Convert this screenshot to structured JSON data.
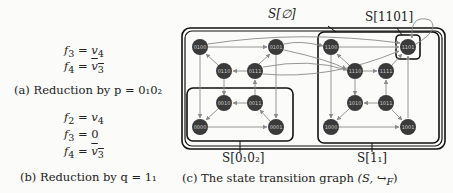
{
  "subfig_a": {
    "equations": [
      {
        "lhs": "f",
        "sub": "3",
        "rhs": "v",
        "rsub": "4",
        "overline": false
      },
      {
        "lhs": "f",
        "sub": "4",
        "rhs": "v",
        "rsub": "3",
        "overline": true
      }
    ],
    "caption": "(a) Reduction by p = 0₁0₂"
  },
  "subfig_b": {
    "equations": [
      {
        "lhs": "f",
        "sub": "2",
        "rhs": "v",
        "rsub": "4",
        "overline": false
      },
      {
        "lhs": "f",
        "sub": "3",
        "rhs": "0",
        "rsub": "",
        "overline": false
      },
      {
        "lhs": "f",
        "sub": "4",
        "rhs": "v",
        "rsub": "3",
        "overline": true
      }
    ],
    "caption": "(b) Reduction by q = 1₁"
  },
  "subfig_c": {
    "caption": "(c) The state transition graph (S, ↪ F)",
    "caption_text": "(c) The state transition graph",
    "caption_math": "(S, ↪",
    "caption_sub": "F",
    "caption_close": ")",
    "regions": {
      "outer": "S[∅]",
      "bottom_left": "S[0₁0₂]",
      "right": "S[1₁]",
      "top_right": "S[1101]"
    },
    "nodes": [
      {
        "id": "0100",
        "x": 200,
        "y": 47
      },
      {
        "id": "0101",
        "x": 276,
        "y": 47
      },
      {
        "id": "0110",
        "x": 224,
        "y": 71
      },
      {
        "id": "0111",
        "x": 255,
        "y": 71
      },
      {
        "id": "0010",
        "x": 224,
        "y": 103
      },
      {
        "id": "0011",
        "x": 255,
        "y": 103
      },
      {
        "id": "0000",
        "x": 200,
        "y": 127
      },
      {
        "id": "0001",
        "x": 276,
        "y": 127
      },
      {
        "id": "1100",
        "x": 331,
        "y": 47
      },
      {
        "id": "1101",
        "x": 408,
        "y": 47
      },
      {
        "id": "1110",
        "x": 355,
        "y": 71
      },
      {
        "id": "1111",
        "x": 386,
        "y": 71
      },
      {
        "id": "1010",
        "x": 355,
        "y": 103
      },
      {
        "id": "1011",
        "x": 386,
        "y": 103
      },
      {
        "id": "1000",
        "x": 331,
        "y": 127
      },
      {
        "id": "1001",
        "x": 408,
        "y": 127
      }
    ]
  },
  "colors": {
    "node_fill": "#3a3a3a",
    "node_text": "#cfcfcf",
    "line": "#8a8a8a",
    "box": "#111111"
  }
}
